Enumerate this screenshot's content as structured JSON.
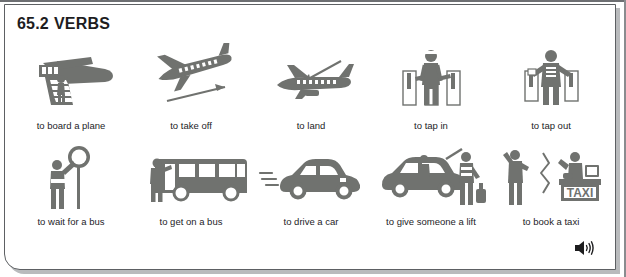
{
  "page": {
    "title_number": "65.2",
    "title_text": "VERBS",
    "icon_color": "#70726f",
    "text_color": "#1d1d1f",
    "border_color": "#5d6063",
    "background": "#ffffff"
  },
  "rows": [
    {
      "items": [
        {
          "label": "to board a plane",
          "icon": "plane-with-boarding-stairs-icon"
        },
        {
          "label": "to take off",
          "icon": "plane-taking-off-icon"
        },
        {
          "label": "to land",
          "icon": "plane-landing-icon"
        },
        {
          "label": "to tap in",
          "icon": "turnstile-tap-in-icon"
        },
        {
          "label": "to tap out",
          "icon": "turnstile-tap-out-icon"
        }
      ]
    },
    {
      "items": [
        {
          "label": "to wait for a bus",
          "icon": "person-at-bus-stop-icon"
        },
        {
          "label": "to get on a bus",
          "icon": "person-boarding-bus-icon"
        },
        {
          "label": "to drive a car",
          "icon": "car-driving-icon"
        },
        {
          "label": "to give someone a lift",
          "icon": "car-with-luggage-icon"
        },
        {
          "label": "to book a taxi",
          "icon": "taxi-desk-booking-icon"
        }
      ]
    }
  ],
  "audio": {
    "icon": "speaker-icon",
    "label": "play audio"
  },
  "taxi_sign_text": "TAXI"
}
